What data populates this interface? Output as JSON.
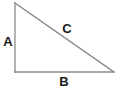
{
  "figure": {
    "name": "right-triangle",
    "background_color": "#ffffff",
    "stroke_color": "#8a8a8a",
    "label_color": "#1a1a1a",
    "stroke_width": 1.3,
    "width": 120,
    "height": 93
  },
  "vertices": {
    "apex": {
      "x": 15,
      "y": 3
    },
    "right_angle": {
      "x": 15,
      "y": 72
    },
    "base_right": {
      "x": 114,
      "y": 72
    }
  },
  "sides": {
    "vertical_leg": {
      "label": "A",
      "from": {
        "x": 15,
        "y": 3
      },
      "to": {
        "x": 15,
        "y": 72
      }
    },
    "horizontal_leg": {
      "label": "B",
      "from": {
        "x": 15,
        "y": 72
      },
      "to": {
        "x": 114,
        "y": 72
      }
    },
    "hypotenuse": {
      "label": "C",
      "from": {
        "x": 15,
        "y": 3
      },
      "to": {
        "x": 114,
        "y": 72
      }
    }
  },
  "labels": {
    "a": "A",
    "b": "B",
    "c": "C"
  }
}
